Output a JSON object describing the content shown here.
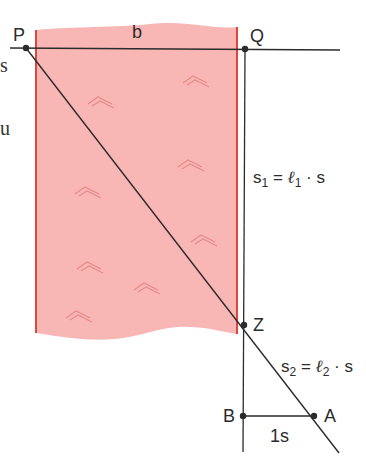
{
  "diagram": {
    "colors": {
      "river_fill": "#f8b7b5",
      "river_edge": "#e0463a",
      "wave_mark": "#e88a86",
      "line": "#2b2b2b",
      "label": "#2b2b2b",
      "background": "#ffffff"
    },
    "points": {
      "P": {
        "label": "P",
        "x": 26,
        "y": 48
      },
      "Q": {
        "label": "Q",
        "x": 245,
        "y": 49
      },
      "Z": {
        "label": "Z",
        "x": 244,
        "y": 325
      },
      "B": {
        "label": "B",
        "x": 243,
        "y": 416
      },
      "A": {
        "label": "A",
        "x": 314,
        "y": 416
      }
    },
    "labels": {
      "b": "b",
      "s1": {
        "lhs": "s",
        "lhs_sub": "1",
        "eq": " = ",
        "ell": "ℓ",
        "ell_sub": "1",
        "rhs": " · s"
      },
      "s2": {
        "lhs": "s",
        "lhs_sub": "2",
        "eq": " = ",
        "ell": "ℓ",
        "ell_sub": "2",
        "rhs": " · s"
      },
      "one_s": "1s"
    },
    "margin_fragments": [
      "s",
      "u"
    ],
    "river": {
      "left_x": 36,
      "right_x": 237,
      "top_y": 30,
      "bottom_y": 335,
      "wave_count": 8
    }
  }
}
